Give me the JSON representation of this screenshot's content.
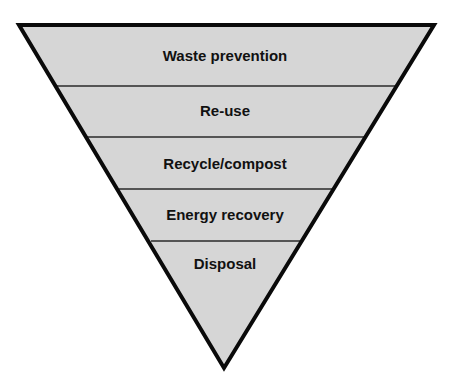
{
  "diagram": {
    "type": "inverted-pyramid",
    "colors": {
      "fill": "#d6d6d6",
      "outline": "#0a0a0a",
      "divider": "#2a2a2a",
      "text": "#111111",
      "background": "#ffffff"
    },
    "tiers": [
      {
        "label": "Waste prevention"
      },
      {
        "label": "Re-use"
      },
      {
        "label": "Recycle/compost"
      },
      {
        "label": "Energy recovery"
      },
      {
        "label": "Disposal"
      }
    ]
  }
}
